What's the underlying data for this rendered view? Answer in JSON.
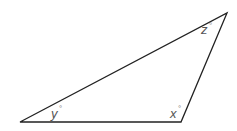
{
  "diagram": {
    "type": "triangle",
    "stroke_color": "#222222",
    "label_color": "#555555",
    "vertices": {
      "left": {
        "x": 20,
        "y": 122
      },
      "bottom_right": {
        "x": 181,
        "y": 122
      },
      "top": {
        "x": 227,
        "y": 13
      }
    },
    "angles": [
      {
        "vertex": "left",
        "variable": "y",
        "unit": "°",
        "label": "y°"
      },
      {
        "vertex": "bottom_right",
        "variable": "x",
        "unit": "°",
        "label": "x°"
      },
      {
        "vertex": "top",
        "variable": "z",
        "unit": "°",
        "label": "z°"
      }
    ]
  },
  "labels": {
    "y": "y",
    "x": "x",
    "z": "z",
    "deg": "°"
  }
}
